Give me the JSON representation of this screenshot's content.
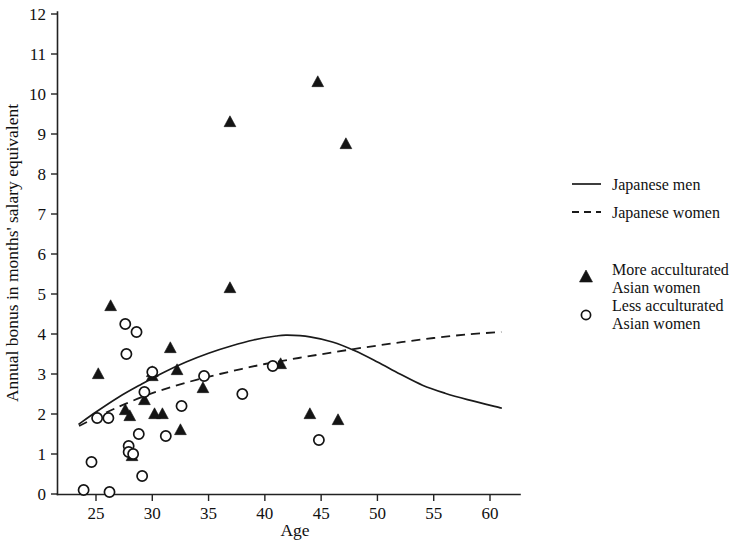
{
  "chart_data": {
    "type": "scatter",
    "title": "",
    "xlabel": "Age",
    "ylabel": "Annual bonus in months' salary equivalent",
    "xlim": [
      23,
      62
    ],
    "ylim": [
      0,
      12
    ],
    "xticks": [
      25,
      30,
      35,
      40,
      45,
      50,
      55,
      60
    ],
    "yticks": [
      0,
      1,
      2,
      3,
      4,
      5,
      6,
      7,
      8,
      9,
      10,
      11,
      12
    ],
    "grid": false,
    "legend_position": "right",
    "series": [
      {
        "name": "Japanese men",
        "type": "line",
        "style": "solid",
        "color": "#1a1a1a",
        "description": "Fitted quadratic curve peaking near age 42",
        "points": [
          [
            23.5,
            1.75
          ],
          [
            25,
            2.05
          ],
          [
            27,
            2.42
          ],
          [
            29,
            2.74
          ],
          [
            31,
            3.04
          ],
          [
            33,
            3.3
          ],
          [
            35,
            3.52
          ],
          [
            37,
            3.7
          ],
          [
            39,
            3.85
          ],
          [
            41,
            3.95
          ],
          [
            42,
            3.97
          ],
          [
            44,
            3.93
          ],
          [
            46,
            3.8
          ],
          [
            48,
            3.58
          ],
          [
            50,
            3.3
          ],
          [
            52,
            3.0
          ],
          [
            54,
            2.72
          ],
          [
            56,
            2.52
          ],
          [
            58,
            2.36
          ],
          [
            61,
            2.15
          ]
        ]
      },
      {
        "name": "Japanese women",
        "type": "line",
        "style": "dashed",
        "color": "#1a1a1a",
        "description": "Fitted slowly rising curve",
        "points": [
          [
            23.5,
            1.7
          ],
          [
            26,
            2.05
          ],
          [
            28,
            2.3
          ],
          [
            30,
            2.52
          ],
          [
            32,
            2.7
          ],
          [
            34,
            2.86
          ],
          [
            36,
            3.0
          ],
          [
            38,
            3.13
          ],
          [
            40,
            3.25
          ],
          [
            43,
            3.4
          ],
          [
            46,
            3.54
          ],
          [
            49,
            3.67
          ],
          [
            52,
            3.79
          ],
          [
            55,
            3.9
          ],
          [
            58,
            3.99
          ],
          [
            61,
            4.05
          ]
        ]
      },
      {
        "name": "More acculturated Asian women",
        "type": "scatter",
        "marker": "triangle",
        "color": "#141414",
        "points": [
          [
            25.2,
            3.0
          ],
          [
            26.3,
            4.7
          ],
          [
            27.6,
            2.1
          ],
          [
            28.0,
            1.95
          ],
          [
            28.0,
            1.1
          ],
          [
            28.2,
            0.95
          ],
          [
            29.3,
            2.35
          ],
          [
            30.0,
            3.05
          ],
          [
            30.0,
            2.95
          ],
          [
            30.2,
            2.0
          ],
          [
            30.9,
            2.0
          ],
          [
            31.6,
            3.65
          ],
          [
            32.2,
            3.1
          ],
          [
            32.5,
            1.6
          ],
          [
            34.5,
            2.65
          ],
          [
            36.9,
            5.15
          ],
          [
            36.9,
            9.3
          ],
          [
            41.4,
            3.25
          ],
          [
            44.0,
            2.0
          ],
          [
            44.7,
            10.3
          ],
          [
            46.5,
            1.85
          ],
          [
            47.2,
            8.75
          ]
        ]
      },
      {
        "name": "Less acculturated Asian women",
        "type": "scatter",
        "marker": "circle",
        "color": "#141414",
        "points": [
          [
            23.9,
            0.1
          ],
          [
            24.6,
            0.8
          ],
          [
            25.1,
            1.9
          ],
          [
            26.1,
            1.9
          ],
          [
            26.2,
            0.05
          ],
          [
            27.6,
            4.25
          ],
          [
            27.7,
            3.5
          ],
          [
            27.9,
            1.2
          ],
          [
            27.9,
            1.05
          ],
          [
            28.3,
            1.0
          ],
          [
            28.6,
            4.05
          ],
          [
            28.8,
            1.5
          ],
          [
            29.1,
            0.45
          ],
          [
            29.3,
            2.55
          ],
          [
            30.0,
            3.05
          ],
          [
            31.2,
            1.45
          ],
          [
            32.6,
            2.2
          ],
          [
            34.6,
            2.95
          ],
          [
            38.0,
            2.5
          ],
          [
            40.7,
            3.2
          ],
          [
            44.8,
            1.35
          ]
        ]
      }
    ]
  },
  "legend": {
    "entries": [
      {
        "label": "Japanese men",
        "marker": "solid-line"
      },
      {
        "label": "Japanese women",
        "marker": "dashed-line"
      },
      {
        "label_line1": "More acculturated",
        "label_line2": "Asian women",
        "marker": "triangle"
      },
      {
        "label_line1": "Less acculturated",
        "label_line2": "Asian women",
        "marker": "circle"
      }
    ]
  },
  "axes": {
    "x_title": "Age",
    "y_title": "Annual bonus in months' salary equivalent",
    "x_tick_labels": [
      "25",
      "30",
      "35",
      "40",
      "45",
      "50",
      "55",
      "60"
    ],
    "y_tick_labels": [
      "0",
      "1",
      "2",
      "3",
      "4",
      "5",
      "6",
      "7",
      "8",
      "9",
      "10",
      "11",
      "12"
    ]
  },
  "colors": {
    "ink": "#141414",
    "axis": "#222222",
    "background": "#ffffff"
  }
}
